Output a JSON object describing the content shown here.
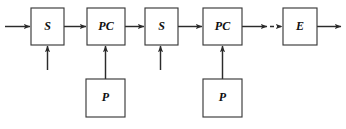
{
  "diagram": {
    "background_color": "#ffffff",
    "box_stroke_color": "#3a3a3a",
    "edge_color": "#2b2b2b",
    "label_color": "#111111",
    "nodes": [
      {
        "id": "s1",
        "label": "S",
        "x": 31,
        "y": 8,
        "w": 33,
        "h": 37
      },
      {
        "id": "pc1",
        "label": "PC",
        "x": 87,
        "y": 8,
        "w": 38,
        "h": 37
      },
      {
        "id": "s2",
        "label": "S",
        "x": 145,
        "y": 8,
        "w": 33,
        "h": 37
      },
      {
        "id": "pc2",
        "label": "PC",
        "x": 203,
        "y": 8,
        "w": 39,
        "h": 37
      },
      {
        "id": "e1",
        "label": "E",
        "x": 283,
        "y": 8,
        "w": 34,
        "h": 37
      },
      {
        "id": "p1",
        "label": "P",
        "x": 86,
        "y": 79,
        "w": 39,
        "h": 38
      },
      {
        "id": "p2",
        "label": "P",
        "x": 203,
        "y": 79,
        "w": 39,
        "h": 38
      }
    ],
    "edges": [
      {
        "id": "in-to-s1",
        "from": "input",
        "to": "s1",
        "style": "solid",
        "arrow": true
      },
      {
        "id": "s1-to-pc1",
        "from": "s1",
        "to": "pc1",
        "style": "solid",
        "arrow": true
      },
      {
        "id": "pc1-to-s2",
        "from": "pc1",
        "to": "s2",
        "style": "solid",
        "arrow": true
      },
      {
        "id": "s2-to-pc2",
        "from": "s2",
        "to": "pc2",
        "style": "solid",
        "arrow": true
      },
      {
        "id": "pc2-to-gap",
        "from": "pc2",
        "to": "gap",
        "style": "solid",
        "arrow": true
      },
      {
        "id": "gap-to-e1",
        "from": "gap",
        "to": "e1",
        "style": "dashed",
        "arrow": true
      },
      {
        "id": "e1-to-out",
        "from": "e1",
        "to": "output",
        "style": "solid",
        "arrow": true
      },
      {
        "id": "up-into-s1",
        "from": "below",
        "to": "s1",
        "style": "solid",
        "arrow": true
      },
      {
        "id": "up-into-s2",
        "from": "below",
        "to": "s2",
        "style": "solid",
        "arrow": true
      },
      {
        "id": "p1-to-pc1",
        "from": "p1",
        "to": "pc1",
        "style": "solid",
        "arrow": true
      },
      {
        "id": "p2-to-pc2",
        "from": "p2",
        "to": "pc2",
        "style": "solid",
        "arrow": true
      }
    ]
  }
}
